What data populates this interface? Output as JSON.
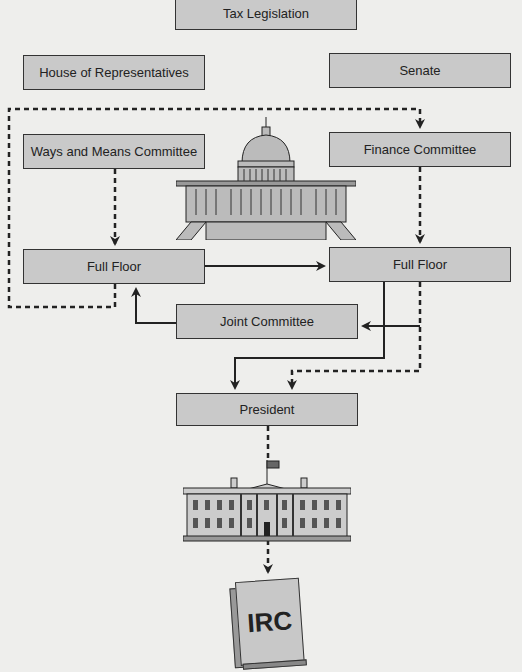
{
  "diagram": {
    "title": "Tax Legislation",
    "nodes": {
      "tax_legislation": "Tax Legislation",
      "house": "House of Representatives",
      "senate": "Senate",
      "ways_means": "Ways and Means Committee",
      "finance": "Finance Committee",
      "full_floor_house": "Full Floor",
      "full_floor_senate": "Full Floor",
      "joint_committee": "Joint Committee",
      "president": "President",
      "irc": "IRC"
    },
    "illustrations": [
      "capitol-building",
      "white-house",
      "irc-book"
    ],
    "edges": [
      {
        "from": "ways_means",
        "to": "full_floor_house",
        "style": "dashed"
      },
      {
        "from": "finance",
        "to": "full_floor_senate",
        "style": "dashed"
      },
      {
        "from": "full_floor_house",
        "to": "finance",
        "style": "dashed"
      },
      {
        "from": "full_floor_house",
        "to": "full_floor_senate",
        "style": "solid"
      },
      {
        "from": "full_floor_senate",
        "to": "joint_committee",
        "style": "solid"
      },
      {
        "from": "joint_committee",
        "to": "full_floor_house",
        "style": "solid"
      },
      {
        "from": "full_floor_senate",
        "to": "president",
        "style": "solid"
      },
      {
        "from": "full_floor_senate",
        "to": "president",
        "style": "dashed"
      },
      {
        "from": "president",
        "to": "irc",
        "style": "dashed"
      }
    ]
  },
  "colors": {
    "box_fill": "#c9c9c9",
    "border": "#333333",
    "background": "#eeeeec"
  }
}
